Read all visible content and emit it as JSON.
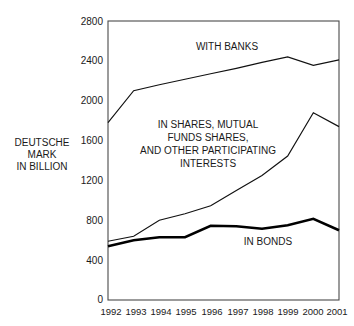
{
  "chart_data": {
    "type": "line",
    "title": "",
    "subtitle": "",
    "xlabel": "",
    "ylabel": "DEUTSCHE MARK IN BILLION",
    "ylabel_lines": [
      "DEUTSCHE",
      "MARK",
      "IN BILLION"
    ],
    "categories": [
      "1992",
      "1993",
      "1994",
      "1995",
      "1996",
      "1997",
      "1998",
      "1999",
      "2000",
      "2001"
    ],
    "x": [
      1992,
      1993,
      1994,
      1995,
      1996,
      1997,
      1998,
      1999,
      2000,
      2001
    ],
    "xlim": [
      1992,
      2001
    ],
    "ylim": [
      0,
      2800
    ],
    "yticks": [
      0,
      400,
      800,
      1200,
      1600,
      2000,
      2400,
      2800
    ],
    "ytick_labels": [
      "0",
      "400",
      "800",
      "1200",
      "1600",
      "2000",
      "2400",
      "2800"
    ],
    "grid": false,
    "legend_position": "inline-annotations",
    "series": [
      {
        "name": "WITH BANKS",
        "label": "WITH BANKS",
        "label_lines": [
          "WITH BANKS"
        ],
        "color": "#111111",
        "line_width": 1.15,
        "values": [
          1780,
          2100,
          2160,
          2215,
          2270,
          2325,
          2385,
          2440,
          2355,
          2410
        ]
      },
      {
        "name": "IN SHARES, MUTUAL FUNDS SHARES, AND OTHER PARTICIPATING INTERESTS",
        "label": "IN SHARES, MUTUAL FUNDS SHARES, AND OTHER PARTICIPATING INTERESTS",
        "label_lines": [
          "IN SHARES, MUTUAL",
          "FUNDS SHARES,",
          "AND OTHER PARTICIPATING",
          "INTERESTS"
        ],
        "color": "#111111",
        "line_width": 1.15,
        "values": [
          590,
          640,
          800,
          865,
          945,
          1100,
          1250,
          1445,
          1880,
          1740
        ]
      },
      {
        "name": "IN BONDS",
        "label": "IN BONDS",
        "label_lines": [
          "IN BONDS"
        ],
        "color": "#000000",
        "line_width": 2.5,
        "values": [
          540,
          600,
          630,
          630,
          745,
          740,
          715,
          750,
          815,
          700
        ]
      }
    ],
    "annotations": [
      {
        "text": "WITH BANKS",
        "x_px": 227,
        "y_px": 50
      },
      {
        "text": "IN SHARES, MUTUAL",
        "x_px": 208,
        "y_px": 128
      },
      {
        "text": "FUNDS SHARES,",
        "x_px": 208,
        "y_px": 141
      },
      {
        "text": "AND OTHER PARTICIPATING",
        "x_px": 208,
        "y_px": 154
      },
      {
        "text": "INTERESTS",
        "x_px": 208,
        "y_px": 167
      },
      {
        "text": "IN BONDS",
        "x_px": 268,
        "y_px": 245
      }
    ],
    "plot_area_px": {
      "left": 108,
      "right": 339,
      "top": 21,
      "bottom": 300
    }
  }
}
